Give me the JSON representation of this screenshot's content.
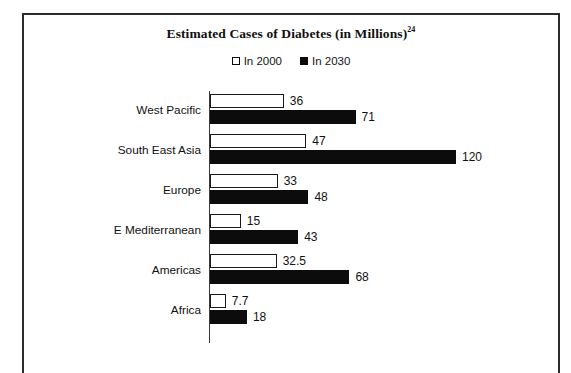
{
  "chart_data": {
    "type": "bar",
    "orientation": "horizontal",
    "title": "Estimated Cases of Diabetes (in Millions)",
    "title_superscript": "24",
    "xlabel": "",
    "ylabel": "",
    "grid": false,
    "legend_position": "top-center",
    "axis_line": "vertical category axis at left of bars",
    "xlim": [
      0,
      130
    ],
    "categories": [
      "West Pacific",
      "South East Asia",
      "Europe",
      "E Mediterranean",
      "Americas",
      "Africa"
    ],
    "series": [
      {
        "name": "In 2000",
        "style": "hollow",
        "color": "#ffffff",
        "edge_color": "#1a1a1a",
        "values": [
          36,
          47,
          33,
          15,
          32.5,
          7.7
        ],
        "labels": [
          "36",
          "47",
          "33",
          "15",
          "32.5",
          "7.7"
        ]
      },
      {
        "name": "In 2030",
        "style": "filled",
        "color": "#0c0c0c",
        "edge_color": "#0c0c0c",
        "values": [
          71,
          120,
          48,
          43,
          68,
          18
        ],
        "labels": [
          "71",
          "120",
          "48",
          "43",
          "68",
          "18"
        ]
      }
    ]
  },
  "legend": {
    "entries": [
      {
        "label": "In 2000",
        "marker": "hollow-square-icon"
      },
      {
        "label": "In 2030",
        "marker": "filled-square-icon"
      }
    ]
  },
  "colors": {
    "series_2000": "#ffffff",
    "series_2030": "#0c0c0c",
    "outline": "#1a1a1a",
    "text": "#111111",
    "frame": "#2b2b2b",
    "background": "#ffffff"
  }
}
